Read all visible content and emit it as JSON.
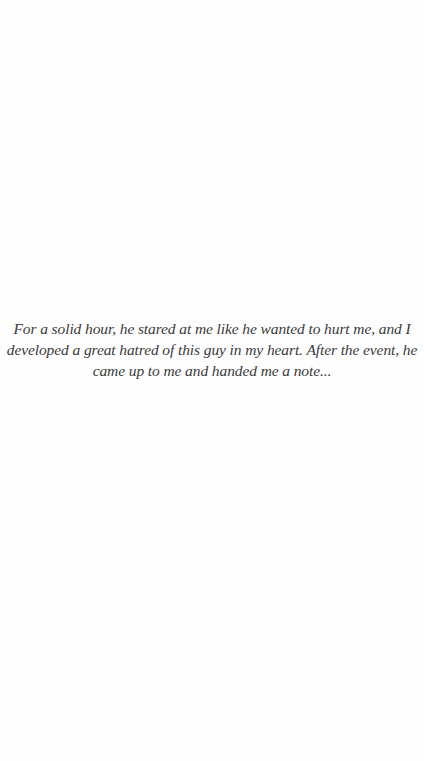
{
  "caption": {
    "lines": [
      "For a solid hour, he stared at me like he wanted to hurt me, and I",
      "developed a great hatred of this guy in my heart. After the event, he",
      "came up to me and handed me a note..."
    ]
  },
  "colors": {
    "background": "#fefefe",
    "text": "#3a3a3a"
  }
}
